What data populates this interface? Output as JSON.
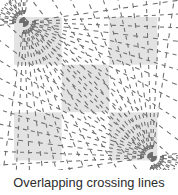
{
  "figure": {
    "caption": "Overlapping crossing lines",
    "background_color": "#ffffff",
    "caption_color": "#2b2b2b"
  },
  "chart_data": {
    "type": "diagram",
    "title": "Overlapping crossing lines",
    "canvas": {
      "width": 178,
      "height": 195
    },
    "square": {
      "x": 14,
      "y": 17,
      "width": 143,
      "height": 143,
      "rows": 3,
      "cols": 3,
      "shaded_color": "#e3e3e3",
      "empty_color": "#ffffff",
      "shaded_cells": [
        [
          0,
          0
        ],
        [
          2,
          0
        ],
        [
          1,
          1
        ],
        [
          0,
          2
        ],
        [
          2,
          2
        ]
      ]
    },
    "line_style": {
      "color": "#6e6e6e",
      "width": 1.05,
      "dash": "4 4",
      "dash_long": "5 5"
    },
    "pencils": [
      {
        "name": "top-left-pencil",
        "focus_x": 24,
        "focus_y": 22,
        "count": 22,
        "angle_start_deg": -8,
        "angle_end_deg": 98,
        "ray_length": 230
      },
      {
        "name": "bottom-right-pencil",
        "focus_x": 152,
        "focus_y": 157,
        "count": 22,
        "angle_start_deg": 172,
        "angle_end_deg": 278,
        "ray_length": 230
      }
    ]
  }
}
